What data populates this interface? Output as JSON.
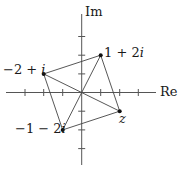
{
  "diagram": {
    "type": "complex-plane",
    "axes": {
      "real_label": "Re",
      "imag_label": "Im",
      "ticks_real": [
        -3,
        -2,
        -1,
        1,
        2,
        3
      ],
      "ticks_imag": [
        -3,
        -2,
        -1,
        1,
        2,
        3
      ]
    },
    "points": [
      {
        "id": "p1",
        "label": "1 + 2i",
        "label_main": "1 + 2",
        "label_i": "i",
        "re": 1,
        "im": 2
      },
      {
        "id": "p2",
        "label": "−2 + i",
        "label_main": "−2 + ",
        "label_i": "i",
        "re": -2,
        "im": 1
      },
      {
        "id": "p3",
        "label": "−1 − 2i",
        "label_main": "−1 − 2",
        "label_i": "i",
        "re": -1,
        "im": -2
      },
      {
        "id": "p4",
        "label": "z",
        "label_main": "",
        "label_i": "z",
        "re": 2,
        "im": -1
      }
    ],
    "segments": [
      [
        "p2",
        "p1"
      ],
      [
        "p1",
        "p4"
      ],
      [
        "p4",
        "p3"
      ],
      [
        "p3",
        "p2"
      ],
      [
        "p2",
        "p4"
      ],
      [
        "p3",
        "p1"
      ]
    ],
    "colors": {
      "line": "#444444",
      "point": "#111111",
      "text": "#1a1a1a"
    }
  }
}
